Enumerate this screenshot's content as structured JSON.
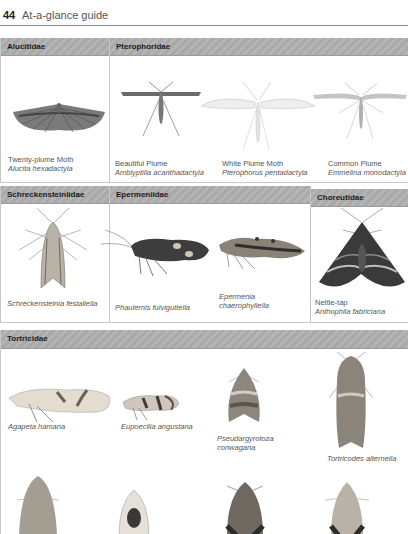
{
  "page": {
    "number": "44",
    "title": "At-a-glance guide"
  },
  "sections": {
    "row1": {
      "alucitidae": {
        "label": "Alucitidae",
        "species": [
          {
            "common": "Twenty-plume Moth",
            "scientific": "Alucita hexadactyla"
          }
        ]
      },
      "pterophoridae": {
        "label": "Pterophoridae",
        "species": [
          {
            "common": "Beautiful Plume",
            "scientific": "Amblyptilia acanthadactyla"
          },
          {
            "common": "White Plume Moth",
            "scientific": "Pterophorus pentadactyla"
          },
          {
            "common": "Common Plume",
            "scientific": "Emmelina monodactyla"
          }
        ]
      }
    },
    "row2": {
      "schreckensteiniidae": {
        "label": "Schreckensteiniidae",
        "species": [
          {
            "scientific": "Schreckensteinia festaliella"
          }
        ]
      },
      "epermeniidae": {
        "label": "Epermeniidae",
        "species": [
          {
            "scientific": "Phaulernis fulviguttella"
          },
          {
            "scientific_line1": "Epermenia",
            "scientific_line2": "chaerophyllella"
          }
        ]
      },
      "choreutidae": {
        "label": "Choreutidae",
        "species": [
          {
            "common": "Nettle-tap",
            "scientific": "Anthophila fabriciana"
          }
        ]
      }
    },
    "tortricidae": {
      "label": "Tortricidae",
      "species": [
        {
          "scientific": "Agapeta hamana"
        },
        {
          "scientific": "Eupoecilia angustana"
        },
        {
          "scientific_line1": "Pseudargyrotoza",
          "scientific_line2": "conwagana"
        },
        {
          "scientific": "Tortricodes alternella"
        }
      ]
    }
  },
  "colors": {
    "band": "#ababab",
    "border": "#c8c8c8",
    "text": "#555555"
  }
}
